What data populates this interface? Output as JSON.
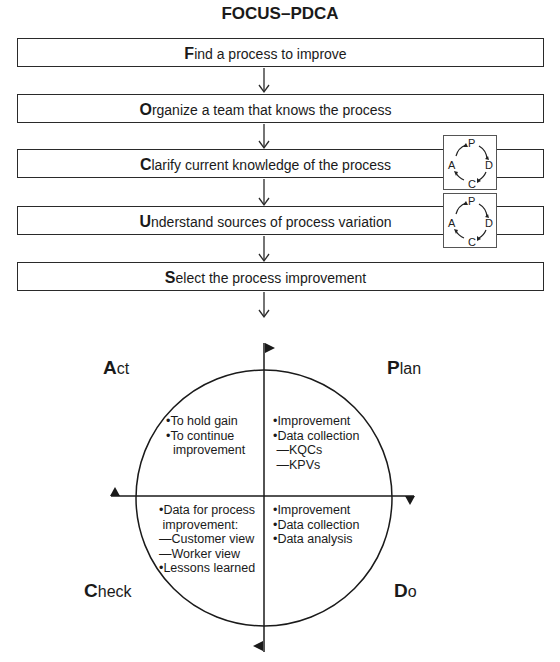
{
  "title": "FOCUS–PDCA",
  "focus_steps": [
    {
      "initial": "F",
      "rest": "ind a process to improve",
      "has_pdca_icon": false
    },
    {
      "initial": "O",
      "rest": "rganize a team that knows the process",
      "has_pdca_icon": false
    },
    {
      "initial": "C",
      "rest": "larify current knowledge of the process",
      "has_pdca_icon": true
    },
    {
      "initial": "U",
      "rest": "nderstand sources of process variation",
      "has_pdca_icon": true
    },
    {
      "initial": "S",
      "rest": "elect the process improvement",
      "has_pdca_icon": false
    }
  ],
  "mini_cycle": {
    "p": "P",
    "d": "D",
    "c": "C",
    "a": "A"
  },
  "cycle": {
    "act": {
      "initial": "A",
      "rest": "ct",
      "items": "•To hold gain\n•To continue\n  improvement"
    },
    "plan": {
      "initial": "P",
      "rest": "lan",
      "items": "•Improvement\n•Data collection\n —KQCs\n —KPVs"
    },
    "check": {
      "initial": "C",
      "rest": "heck",
      "items": "•Data for process\n improvement:\n—Customer view\n—Worker view\n•Lessons learned"
    },
    "do": {
      "initial": "D",
      "rest": "o",
      "items": "•Improvement\n•Data collection\n•Data analysis"
    }
  }
}
